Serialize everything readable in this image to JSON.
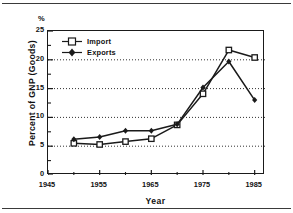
{
  "chart_data": {
    "type": "line",
    "title": "",
    "xlabel": "Year",
    "ylabel": "Percent of GNP (Goods)",
    "y_unit_symbol": "%",
    "xlim": [
      1945,
      1987
    ],
    "ylim": [
      0,
      25
    ],
    "xticks": [
      1945,
      1955,
      1965,
      1975,
      1985
    ],
    "yticks": [
      0,
      5,
      10,
      15,
      20,
      25
    ],
    "grid": "horizontal-dotted",
    "legend_position": "top-left-inside",
    "series": [
      {
        "name": "Import",
        "marker": "open-square",
        "color": "#1a1a1a",
        "x": [
          1950,
          1955,
          1960,
          1965,
          1970,
          1975,
          1980,
          1985
        ],
        "values": [
          5.5,
          5.3,
          5.8,
          6.3,
          8.7,
          14.1,
          21.7,
          20.4
        ]
      },
      {
        "name": "Exports",
        "marker": "filled-diamond",
        "color": "#1a1a1a",
        "x": [
          1950,
          1955,
          1960,
          1965,
          1970,
          1975,
          1980,
          1985
        ],
        "values": [
          6.2,
          6.6,
          7.7,
          7.7,
          8.8,
          15.2,
          19.7,
          13.0
        ]
      }
    ]
  }
}
